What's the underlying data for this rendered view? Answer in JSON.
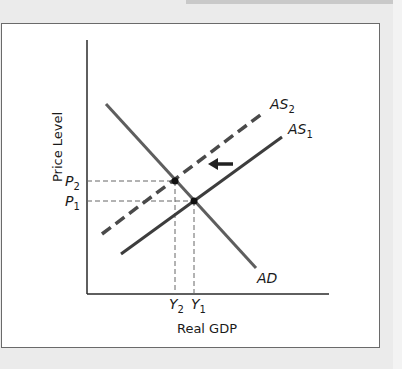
{
  "figure": {
    "axes": {
      "ylabel": "Price Level",
      "xlabel": "Real GDP"
    },
    "curves": {
      "ad": {
        "label": "AD",
        "color": "#5a5a5a"
      },
      "as1": {
        "label_main": "AS",
        "label_sub": "1",
        "color": "#3d3d3d"
      },
      "as2": {
        "label_main": "AS",
        "label_sub": "2",
        "color": "#4a4a4a",
        "style": "dashed"
      }
    },
    "price_ticks": [
      {
        "main": "P",
        "sub": "2"
      },
      {
        "main": "P",
        "sub": "1"
      }
    ],
    "output_ticks": [
      {
        "main": "Y",
        "sub": "2"
      },
      {
        "main": "Y",
        "sub": "1"
      }
    ],
    "shift_arrow": {
      "direction": "left"
    }
  }
}
